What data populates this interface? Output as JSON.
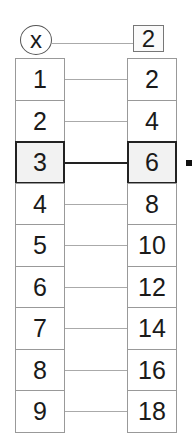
{
  "header": {
    "variable": "x",
    "multiplier": "2"
  },
  "rows": [
    {
      "left": "1",
      "right": "2"
    },
    {
      "left": "2",
      "right": "4"
    },
    {
      "left": "3",
      "right": "6",
      "highlighted": true
    },
    {
      "left": "4",
      "right": "8"
    },
    {
      "left": "5",
      "right": "10"
    },
    {
      "left": "6",
      "right": "12"
    },
    {
      "left": "7",
      "right": "14"
    },
    {
      "left": "8",
      "right": "16"
    },
    {
      "left": "9",
      "right": "18"
    }
  ],
  "colors": {
    "highlight_border": "#222222",
    "highlight_fill": "#f2f2f2",
    "line": "#aaaaaa"
  }
}
